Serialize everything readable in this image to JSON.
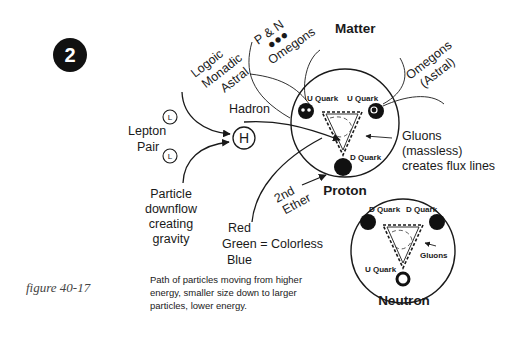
{
  "badge": {
    "number": "2"
  },
  "figure_label": "figure 40-17",
  "labels": {
    "matter": "Matter",
    "pn": "P & N",
    "pn_dots": "●●●",
    "omegons_top": "Omegons",
    "logoic": "Logoic",
    "monadic": "Monadic",
    "astral": "Astral",
    "hadron": "Hadron",
    "h_symbol": "H",
    "lepton": "Lepton",
    "pair": "Pair",
    "l_symbol": "L",
    "particle": "Particle",
    "downflow": "downflow",
    "creating": "creating",
    "gravity": "gravity",
    "red": "Red",
    "green": "Green = Colorless",
    "blue": "Blue",
    "second": "2nd",
    "ether": "Ether",
    "omegons_astral_1": "Omegons",
    "omegons_astral_2": "(Astral)",
    "gluons": "Gluons",
    "massless": "(massless)",
    "flux": "creates flux lines"
  },
  "proton": {
    "title": "Proton",
    "quark_top_left": "U Quark",
    "quark_top_right": "U Quark",
    "quark_bottom": "D Quark"
  },
  "neutron": {
    "title": "Neutron",
    "quark_top_left": "D Quark",
    "quark_top_right": "D Quark",
    "quark_bottom": "U Quark",
    "gluons": "Gluons"
  },
  "caption": {
    "line1": "Path of particles moving from higher",
    "line2": "energy, smaller size down to larger",
    "line3": "particles, lower energy."
  }
}
